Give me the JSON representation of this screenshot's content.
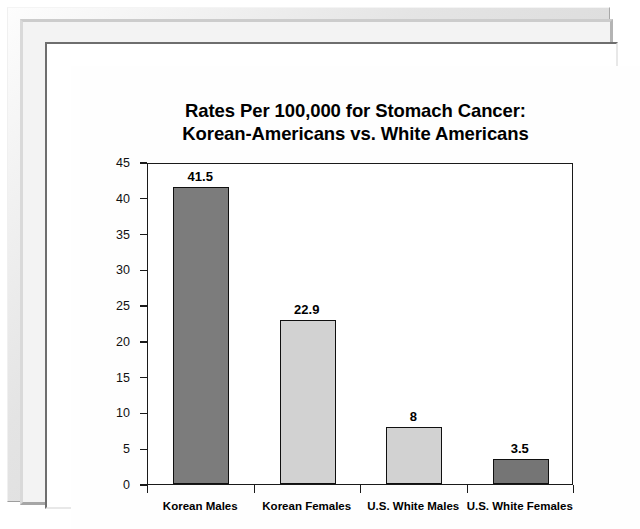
{
  "frame": {
    "style_name": "beveled-picture-frame"
  },
  "chart_data": {
    "type": "bar",
    "title": "Rates Per 100,000 for Stomach Cancer: Korean-Americans vs. White Americans",
    "title_line1": "Rates Per 100,000 for Stomach Cancer:",
    "title_line2": "Korean-Americans vs. White Americans",
    "xlabel": "",
    "ylabel": "",
    "categories": [
      "Korean Males",
      "Korean Females",
      "U.S. White Males",
      "U.S. White Females"
    ],
    "values": [
      41.5,
      22.9,
      8,
      3.5
    ],
    "value_labels": [
      "41.5",
      "22.9",
      "8",
      "3.5"
    ],
    "bar_colors": [
      "#7c7c7c",
      "#d2d2d2",
      "#d2d2d2",
      "#757575"
    ],
    "bar_border_color": "#101010",
    "ylim": [
      0,
      45
    ],
    "yticks": [
      0,
      5,
      10,
      15,
      20,
      25,
      30,
      35,
      40,
      45
    ],
    "ytick_labels": [
      "0",
      "5",
      "10",
      "15",
      "20",
      "25",
      "30",
      "35",
      "40",
      "45"
    ],
    "grid": false,
    "legend": false,
    "plot_background": "#ffffff",
    "axis_color": "#1a1a1a"
  }
}
